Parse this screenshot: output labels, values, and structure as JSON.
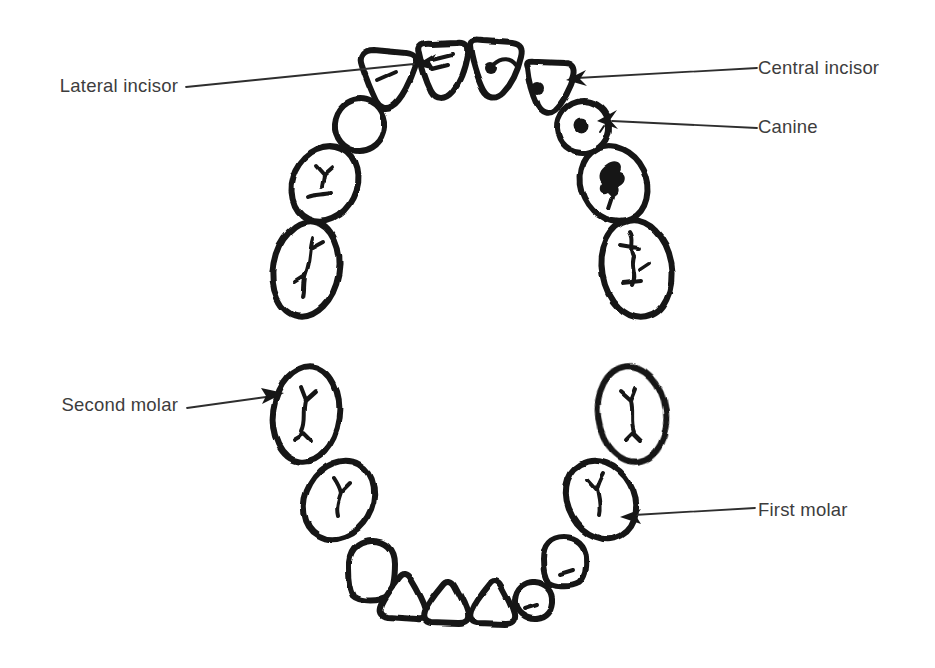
{
  "diagram": {
    "labels": {
      "lateral_incisor": "Lateral incisor",
      "central_incisor": "Central incisor",
      "canine": "Canine",
      "second_molar": "Second molar",
      "first_molar": "First molar"
    },
    "colors": {
      "ink": "#161616",
      "label_text": "#3d3d3d",
      "background": "#ffffff"
    }
  }
}
